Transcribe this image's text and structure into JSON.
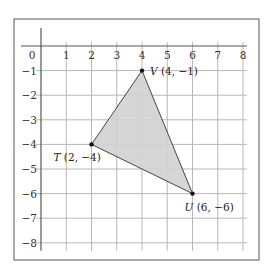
{
  "diagram": {
    "type": "coordinate-plane-triangle",
    "x_ticks": [
      "0",
      "1",
      "2",
      "3",
      "4",
      "5",
      "6",
      "7",
      "8"
    ],
    "y_ticks": [
      "-1",
      "-2",
      "-3",
      "-4",
      "-5",
      "-6",
      "-7",
      "-8"
    ],
    "points": [
      {
        "name": "V",
        "coords": "(4, −1)",
        "x": 4,
        "y": -1
      },
      {
        "name": "T",
        "coords": "(2, −4)",
        "x": 2,
        "y": -4
      },
      {
        "name": "U",
        "coords": "(6, −6)",
        "x": 6,
        "y": -6
      }
    ],
    "colors": {
      "fill": "#d2d2d2",
      "grid": "#b8b8b8",
      "axis": "#555555",
      "frame": "#555555",
      "edge": "#444444"
    }
  }
}
